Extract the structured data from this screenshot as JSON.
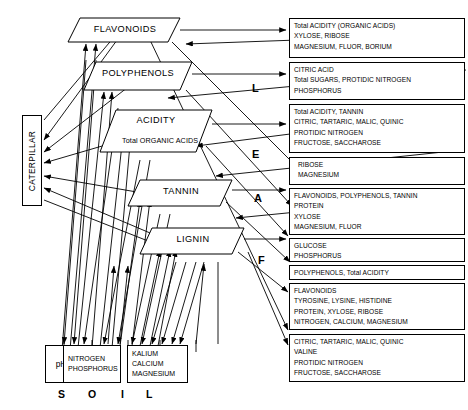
{
  "diagram": {
    "title_letters_vertical": [
      "L",
      "E",
      "A",
      "F"
    ],
    "soil_label_letters": [
      "S",
      "O",
      "I",
      "L"
    ],
    "caterpillar": {
      "label": "CATERPILLAR"
    },
    "leaf_nodes": [
      {
        "name": "flavonoids",
        "label": "FLAVONOIDS",
        "sublabel": ""
      },
      {
        "name": "polyphenols",
        "label": "POLYPHENOLS",
        "sublabel": ""
      },
      {
        "name": "acidity",
        "label": "ACIDITY",
        "sublabel": "Total ORGANIC ACIDS"
      },
      {
        "name": "tannin",
        "label": "TANNIN",
        "sublabel": ""
      },
      {
        "name": "lignin",
        "label": "LIGNIN",
        "sublabel": ""
      }
    ],
    "soil_nodes": [
      {
        "name": "ph",
        "lines": [
          "pH"
        ]
      },
      {
        "name": "nitrogen-phosphorus",
        "lines": [
          "NITROGEN",
          "PHOSPHORUS"
        ]
      },
      {
        "name": "kalium-calcium-magnesium",
        "lines": [
          "KALIUM",
          "CALCIUM",
          "MAGNESIUM"
        ]
      }
    ],
    "result_boxes": [
      {
        "name": "result-box-1",
        "lines": [
          "Total ACIDITY (ORGANIC ACIDS)",
          "XYLOSE, RIBOSE",
          "MAGNESIUM, FLUOR, BORIUM"
        ]
      },
      {
        "name": "result-box-2",
        "lines": [
          "CITRIC ACID",
          "Total SUGARS, PROTIDIC NITROGEN",
          "PHOSPHORUS"
        ]
      },
      {
        "name": "result-box-3",
        "lines": [
          "Total ACIDITY, TANNIN",
          "CITRIC, TARTARIC, MALIC, QUINIC",
          "PROTIDIC NITROGEN",
          "FRUCTOSE, SACCHAROSE"
        ]
      },
      {
        "name": "result-box-4",
        "lines": [
          "RIBOSE",
          "MAGNESIUM"
        ]
      },
      {
        "name": "result-box-5",
        "lines": [
          "FLAVONOIDS, POLYPHENOLS, TANNIN",
          "PROTEIN",
          "XYLOSE",
          "MAGNESIUM, FLUOR"
        ]
      },
      {
        "name": "result-box-6",
        "lines": [
          "GLUCOSE",
          "PHOSPHORUS"
        ]
      },
      {
        "name": "result-box-7",
        "lines": [
          "POLYPHENOLS, Total ACIDITY"
        ]
      },
      {
        "name": "result-box-8",
        "lines": [
          "FLAVONOIDS",
          "TYROSINE, LYSINE, HISTIDINE",
          "PROTEIN, XYLOSE, RIBOSE",
          "NITROGEN, CALCIUM, MAGNESIUM"
        ]
      },
      {
        "name": "result-box-9",
        "lines": [
          "CITRIC, TARTARIC, MALIC, QUINIC",
          "VALINE",
          "PROTIDIC NITROGEN",
          "FRUCTOSE, SACCHAROSE"
        ]
      }
    ],
    "colors": {
      "stroke": "#000000",
      "background": "#ffffff"
    }
  }
}
